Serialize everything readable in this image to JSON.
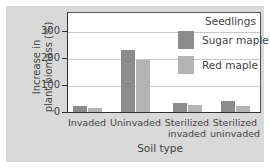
{
  "chart_data": {
    "type": "bar",
    "title": "",
    "xlabel": "Soil type",
    "ylabel": "Increase in plant biomass (%)",
    "ylabel_lines": [
      "Increase in",
      "plant biomass (%)"
    ],
    "categories": [
      "Invaded",
      "Uninvaded",
      "Sterilized invaded",
      "Sterilized uninvaded"
    ],
    "category_lines": [
      [
        "Invaded"
      ],
      [
        "Uninvaded"
      ],
      [
        "Sterilized",
        "invaded"
      ],
      [
        "Sterilized",
        "uninvaded"
      ]
    ],
    "series": [
      {
        "name": "Sugar maple",
        "color": "#8c8c8c",
        "values": [
          25,
          233,
          37,
          44
        ]
      },
      {
        "name": "Red maple",
        "color": "#b4b4b4",
        "values": [
          18,
          196,
          30,
          26
        ]
      }
    ],
    "legend_title": "Seedlings",
    "legend_position": "upper right",
    "yticks": [
      0,
      100,
      200,
      300
    ],
    "ylim": [
      0,
      370
    ],
    "grid": true
  }
}
